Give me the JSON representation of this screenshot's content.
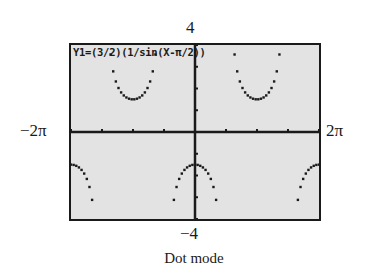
{
  "calculator_screen": {
    "equation": "Y1=(3/2)(1/sin(X-π/2))",
    "mode": "Dot mode"
  },
  "window": {
    "xmin_label": "−2π",
    "xmax_label": "2π",
    "ymin_label": "−4",
    "ymax_label": "4",
    "xmin": -6.2832,
    "xmax": 6.2832,
    "ymin": -4,
    "ymax": 4,
    "xscale": "π/2",
    "yscale": 1
  },
  "caption": "Dot mode",
  "colors": {
    "screen_bg": "#e3e3e3",
    "ink": "#1a1a1a"
  }
}
